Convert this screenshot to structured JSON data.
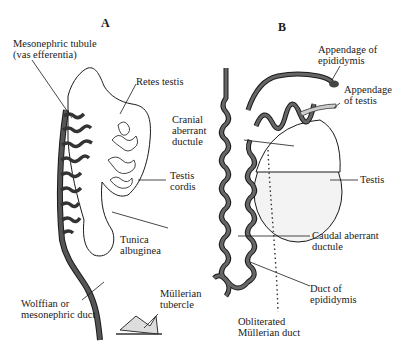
{
  "figure": {
    "panels": [
      {
        "id": "A",
        "label": "A"
      },
      {
        "id": "B",
        "label": "B"
      }
    ],
    "panel_a_labels": {
      "mesonephric_tubule": [
        "Mesonephric tubule",
        "(vas efferentia)"
      ],
      "retes_testis": [
        "Retes testis"
      ],
      "testis_cordis": [
        "Testis",
        "cordis"
      ],
      "tunica_albuginea": [
        "Tunica",
        "albuginea"
      ],
      "wolffian_duct": [
        "Wolffian or",
        "mesonephric duct"
      ],
      "mullerian_tubercle": [
        "Müllerian",
        "tubercle"
      ]
    },
    "panel_b_labels": {
      "appendage_epididymis": [
        "Appendage of",
        "epididymis"
      ],
      "appendage_testis": [
        "Appendage",
        "of testis"
      ],
      "cranial_aberrant": [
        "Cranial",
        "aberrant",
        "ductule"
      ],
      "testis": [
        "Testis"
      ],
      "caudal_aberrant": [
        "Caudal aberrant",
        "ductule"
      ],
      "duct_epididymis": [
        "Duct of",
        "epididymis"
      ],
      "obliterated_mullerian": [
        "Obliterated",
        "Müllerian duct"
      ]
    },
    "colors": {
      "ink": "#1a1a1a",
      "duct_fill": "#555555",
      "background": "#ffffff"
    }
  }
}
